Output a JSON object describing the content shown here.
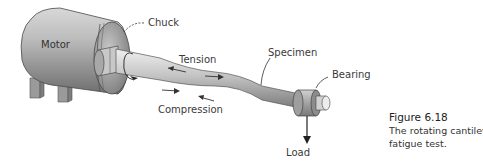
{
  "figure": {
    "labels": {
      "motor": "Motor",
      "chuck": "Chuck",
      "tension": "Tension",
      "specimen": "Specimen",
      "bearing": "Bearing",
      "compression": "Compression",
      "load": "Load"
    },
    "caption": {
      "number": "Figure 6.18",
      "line1": "The rotating cantilever beam",
      "line2": "fatigue test."
    }
  }
}
